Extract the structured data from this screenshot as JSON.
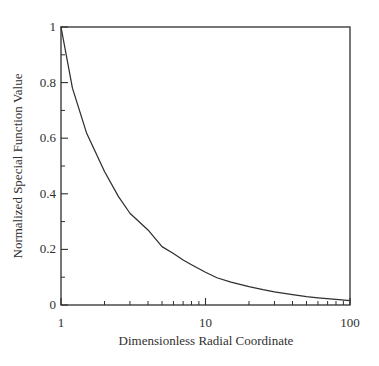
{
  "figure": {
    "background": "#ffffff",
    "line_color": "#2f2f2f",
    "text_color": "#2f2f2f"
  },
  "chart_data": {
    "type": "line",
    "title": "",
    "xlabel": "Dimensionless Radial Coordinate",
    "ylabel": "Normalized Special Function Value",
    "x_scale": "log",
    "y_scale": "linear",
    "xlim": [
      1,
      100
    ],
    "ylim": [
      0,
      1
    ],
    "grid": false,
    "legend": null,
    "x_major_ticks": [
      1,
      10,
      100
    ],
    "x_major_tick_labels": [
      "1",
      "10",
      "100"
    ],
    "x_minor_ticks": [
      2,
      3,
      4,
      5,
      6,
      7,
      8,
      9,
      20,
      30,
      40,
      50,
      60,
      70,
      80,
      90
    ],
    "y_major_ticks": [
      0,
      0.2,
      0.4,
      0.6,
      0.8,
      1
    ],
    "y_major_tick_labels": [
      "0",
      "0.2",
      "0.4",
      "0.6",
      "0.8",
      "1"
    ],
    "y_minor_ticks": [
      0.1,
      0.3,
      0.5,
      0.7,
      0.9
    ],
    "series": [
      {
        "name": "normalized-special-function",
        "points": [
          [
            1,
            1.0
          ],
          [
            1.2,
            0.78
          ],
          [
            1.5,
            0.62
          ],
          [
            2,
            0.48
          ],
          [
            2.5,
            0.39
          ],
          [
            3,
            0.33
          ],
          [
            4,
            0.27
          ],
          [
            5,
            0.21
          ],
          [
            6,
            0.185
          ],
          [
            7,
            0.162
          ],
          [
            8,
            0.145
          ],
          [
            10,
            0.118
          ],
          [
            12,
            0.098
          ],
          [
            15,
            0.082
          ],
          [
            20,
            0.066
          ],
          [
            25,
            0.055
          ],
          [
            30,
            0.047
          ],
          [
            40,
            0.037
          ],
          [
            50,
            0.03
          ],
          [
            60,
            0.026
          ],
          [
            80,
            0.02
          ],
          [
            100,
            0.016
          ]
        ]
      }
    ]
  }
}
